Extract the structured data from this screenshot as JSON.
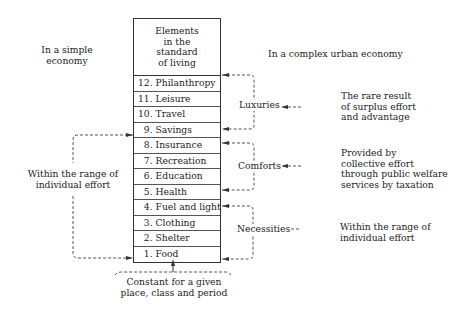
{
  "headings": {
    "left": [
      "In a simple",
      "economy"
    ],
    "right": "In a complex urban economy"
  },
  "table": {
    "header": [
      "Elements",
      "in the",
      "standard",
      "of living"
    ],
    "rows": [
      {
        "num": "12.",
        "label": "Philanthropy"
      },
      {
        "num": "11.",
        "label": "Leisure"
      },
      {
        "num": "10.",
        "label": "Travel"
      },
      {
        "num": "9.",
        "label": "Savings"
      },
      {
        "num": "8.",
        "label": "Insurance"
      },
      {
        "num": "7.",
        "label": "Recreation"
      },
      {
        "num": "6.",
        "label": "Education"
      },
      {
        "num": "5.",
        "label": "Health"
      },
      {
        "num": "4.",
        "label": "Fuel and light"
      },
      {
        "num": "3.",
        "label": "Clothing"
      },
      {
        "num": "2.",
        "label": "Shelter"
      },
      {
        "num": "1.",
        "label": "Food"
      }
    ]
  },
  "groups": {
    "luxuries": {
      "label": "Luxuries",
      "description": [
        "The rare result",
        "of surplus effort",
        "and advantage"
      ]
    },
    "comforts": {
      "label": "Comforts",
      "description": [
        "Provided by",
        "collective effort",
        "through public welfare",
        "services by taxation"
      ]
    },
    "necessities": {
      "label": "Necessities",
      "description": [
        "Within the range of",
        "individual effort"
      ]
    }
  },
  "left_bracket": {
    "label": [
      "Within the range of",
      "individual effort"
    ]
  },
  "bottom_note": [
    "Constant for a given",
    "place, class and period"
  ],
  "colors": {
    "line": "#333333",
    "dashed": "#444444",
    "text": "#222222",
    "background": "#ffffff"
  }
}
